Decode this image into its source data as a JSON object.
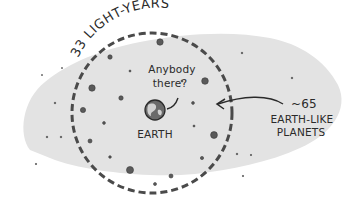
{
  "diagram": {
    "radius_label": "33 LIGHT-YEARS",
    "center_label": "EARTH",
    "speech_line1": "Anybody",
    "speech_line2": "there?",
    "count_label": "~65",
    "planets_line1": "EARTH-LIKE",
    "planets_line2": "PLANETS"
  },
  "colors": {
    "background": "#ffffff",
    "blob": "#e3e3e3",
    "circle": "#4a4a4a",
    "planet": "#5a5a5a",
    "ink": "#2a2a2a"
  }
}
